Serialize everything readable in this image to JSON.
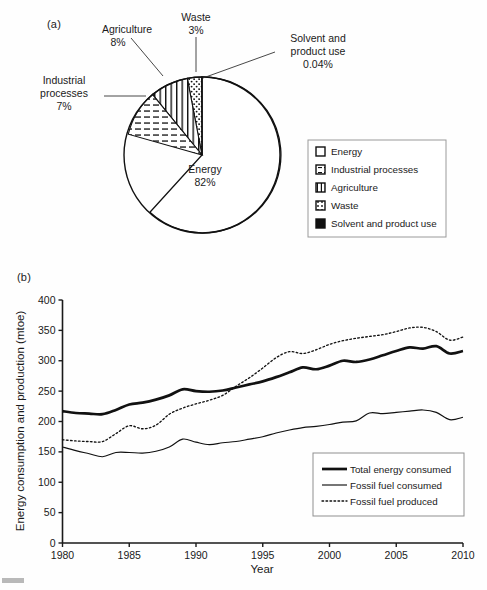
{
  "figure": {
    "panel_a_label": "(a)",
    "panel_b_label": "(b)"
  },
  "chart_data": [
    {
      "type": "pie",
      "title": "",
      "panel": "(a)",
      "categories": [
        "Energy",
        "Industrial processes",
        "Agriculture",
        "Waste",
        "Solvent and product use"
      ],
      "values": [
        82,
        7,
        8,
        3,
        0.04
      ],
      "value_unit": "%",
      "callouts": [
        {
          "name": "Agriculture",
          "label": "Agriculture",
          "value": "8%"
        },
        {
          "name": "Waste",
          "label": "Waste",
          "value": "3%"
        },
        {
          "name": "Solvent and product use",
          "label_line1": "Solvent and",
          "label_line2": "product use",
          "value": "0.04%"
        },
        {
          "name": "Industrial processes",
          "label_line1": "Industrial",
          "label_line2": "processes",
          "value": "7%"
        },
        {
          "name": "Energy",
          "label": "Energy",
          "value": "82%"
        }
      ],
      "legend_position": "right",
      "legend": [
        {
          "label": "Energy",
          "pattern": "blank"
        },
        {
          "label": "Industrial processes",
          "pattern": "horizontal-dashes"
        },
        {
          "label": "Agriculture",
          "pattern": "vertical-lines"
        },
        {
          "label": "Waste",
          "pattern": "dots"
        },
        {
          "label": "Solvent and product use",
          "pattern": "solid-black"
        }
      ]
    },
    {
      "type": "line",
      "panel": "(b)",
      "title": "",
      "xlabel": "Year",
      "ylabel": "Energy consumption and production (mtoe)",
      "xlim": [
        1980,
        2010
      ],
      "ylim": [
        0,
        400
      ],
      "xticks": [
        1980,
        1985,
        1990,
        1995,
        2000,
        2005,
        2010
      ],
      "xticklabels": [
        "1980",
        "1985",
        "1990",
        "1995",
        "2000",
        "2005",
        "2010"
      ],
      "yticks": [
        0,
        50,
        100,
        150,
        200,
        250,
        300,
        350,
        400
      ],
      "yticklabels": [
        "0",
        "50",
        "100",
        "150",
        "200",
        "250",
        "300",
        "350",
        "400"
      ],
      "grid": false,
      "legend_position": "lower-right",
      "x": [
        1980,
        1981,
        1982,
        1983,
        1984,
        1985,
        1986,
        1987,
        1988,
        1989,
        1990,
        1991,
        1992,
        1993,
        1994,
        1995,
        1996,
        1997,
        1998,
        1999,
        2000,
        2001,
        2002,
        2003,
        2004,
        2005,
        2006,
        2007,
        2008,
        2009,
        2010
      ],
      "series": [
        {
          "name": "Total energy consumed",
          "style": "thick-solid",
          "values": [
            217,
            214,
            213,
            212,
            219,
            228,
            231,
            236,
            243,
            253,
            250,
            249,
            251,
            256,
            261,
            266,
            273,
            281,
            289,
            286,
            292,
            300,
            298,
            302,
            309,
            316,
            322,
            320,
            324,
            312,
            316
          ]
        },
        {
          "name": "Fossil fuel consumed",
          "style": "thin-solid",
          "values": [
            158,
            152,
            147,
            142,
            149,
            149,
            148,
            151,
            158,
            171,
            166,
            162,
            165,
            167,
            171,
            175,
            181,
            186,
            190,
            192,
            195,
            199,
            201,
            214,
            213,
            215,
            217,
            219,
            215,
            203,
            207
          ]
        },
        {
          "name": "Fossil fuel produced",
          "style": "dotted",
          "values": [
            170,
            168,
            167,
            167,
            180,
            193,
            188,
            194,
            212,
            222,
            229,
            235,
            243,
            258,
            272,
            288,
            305,
            315,
            312,
            318,
            327,
            333,
            337,
            340,
            343,
            348,
            354,
            355,
            348,
            334,
            339
          ]
        }
      ]
    }
  ]
}
